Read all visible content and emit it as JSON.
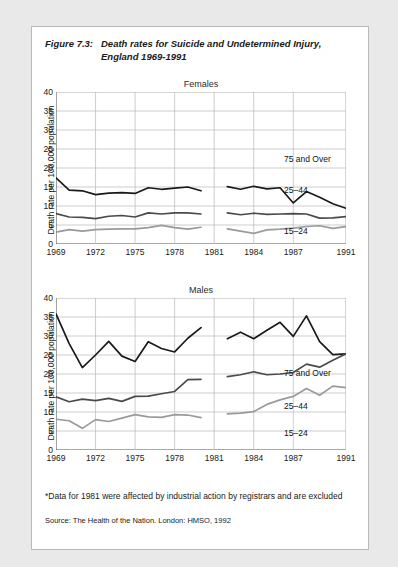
{
  "figure": {
    "number": "Figure 7.3:",
    "title": "Death rates for Suicide and Undetermined Injury, England 1969-1991"
  },
  "footnote": "*Data for 1981 were affected by industrial action by registrars and are excluded",
  "source": "Source: The Health of the Nation. London: HMSO, 1992",
  "axis": {
    "ylabel": "Death rate per 100,000 population",
    "yticks": [
      0,
      5,
      10,
      15,
      20,
      25,
      30,
      35,
      40
    ],
    "xticks": [
      1969,
      1972,
      1975,
      1978,
      1981,
      1984,
      1987,
      1991
    ]
  },
  "colors": {
    "series_75_plus": "#1a1a1a",
    "series_25_44": "#4a4a4a",
    "series_15_24": "#9a9a9a",
    "grid": "#b8b8b8",
    "axis": "#555555",
    "page_background": "#ffffff",
    "canvas_background": "#e9e9e9"
  },
  "chart_data": [
    {
      "type": "line",
      "title": "Females",
      "xlabel": "",
      "ylabel": "Death rate per 100,000 population",
      "xlim": [
        1969,
        1991
      ],
      "ylim": [
        0,
        40
      ],
      "grid": true,
      "legend_position": "inline-right",
      "xticks": [
        1969,
        1972,
        1975,
        1978,
        1981,
        1984,
        1987,
        1991
      ],
      "yticks": [
        0,
        5,
        10,
        15,
        20,
        25,
        30,
        35,
        40
      ],
      "gap_years": [
        1981
      ],
      "series": [
        {
          "name": "75 and Over",
          "color": "#1a1a1a",
          "x": [
            1969,
            1970,
            1971,
            1972,
            1973,
            1974,
            1975,
            1976,
            1977,
            1978,
            1979,
            1980,
            1982,
            1983,
            1984,
            1985,
            1986,
            1987,
            1988,
            1989,
            1990,
            1991
          ],
          "values": [
            17.4,
            14.2,
            14.0,
            13.0,
            13.4,
            13.5,
            13.3,
            14.8,
            14.4,
            14.7,
            15.0,
            14.0,
            15.1,
            14.4,
            15.2,
            14.5,
            14.8,
            10.8,
            13.8,
            12.3,
            10.6,
            9.4
          ]
        },
        {
          "name": "25–44",
          "color": "#4a4a4a",
          "x": [
            1969,
            1970,
            1971,
            1972,
            1973,
            1974,
            1975,
            1976,
            1977,
            1978,
            1979,
            1980,
            1982,
            1983,
            1984,
            1985,
            1986,
            1987,
            1988,
            1989,
            1990,
            1991
          ],
          "values": [
            8.0,
            7.1,
            7.0,
            6.7,
            7.3,
            7.5,
            7.1,
            8.2,
            7.9,
            8.2,
            8.2,
            7.9,
            8.2,
            7.7,
            8.1,
            7.8,
            7.9,
            8.0,
            7.9,
            6.8,
            6.9,
            7.2
          ]
        },
        {
          "name": "15–24",
          "color": "#9a9a9a",
          "x": [
            1969,
            1970,
            1971,
            1972,
            1973,
            1974,
            1975,
            1976,
            1977,
            1978,
            1979,
            1980,
            1982,
            1983,
            1984,
            1985,
            1986,
            1987,
            1988,
            1989,
            1990,
            1991
          ],
          "values": [
            3.1,
            3.8,
            3.4,
            3.8,
            3.9,
            4.0,
            4.0,
            4.3,
            4.9,
            4.3,
            3.9,
            4.4,
            4.0,
            3.4,
            2.8,
            3.7,
            3.9,
            4.2,
            4.6,
            4.8,
            4.1,
            4.6
          ]
        }
      ]
    },
    {
      "type": "line",
      "title": "Males",
      "xlabel": "",
      "ylabel": "Death rate per 100,000 population",
      "xlim": [
        1969,
        1991
      ],
      "ylim": [
        0,
        40
      ],
      "grid": true,
      "legend_position": "inline-right",
      "xticks": [
        1969,
        1972,
        1975,
        1978,
        1981,
        1984,
        1987,
        1991
      ],
      "yticks": [
        0,
        5,
        10,
        15,
        20,
        25,
        30,
        35,
        40
      ],
      "gap_years": [
        1981
      ],
      "series": [
        {
          "name": "75 and Over",
          "color": "#1a1a1a",
          "x": [
            1969,
            1970,
            1971,
            1972,
            1973,
            1974,
            1975,
            1976,
            1977,
            1978,
            1979,
            1980,
            1982,
            1983,
            1984,
            1985,
            1986,
            1987,
            1988,
            1989,
            1990,
            1991
          ],
          "values": [
            35.8,
            28.0,
            21.7,
            25.0,
            28.6,
            24.7,
            23.3,
            28.5,
            26.7,
            25.8,
            29.4,
            32.2,
            29.3,
            31.0,
            29.3,
            31.5,
            33.6,
            29.9,
            35.3,
            28.5,
            25.1,
            25.3
          ]
        },
        {
          "name": "25–44",
          "color": "#4a4a4a",
          "x": [
            1969,
            1970,
            1971,
            1972,
            1973,
            1974,
            1975,
            1976,
            1977,
            1978,
            1979,
            1980,
            1982,
            1983,
            1984,
            1985,
            1986,
            1987,
            1988,
            1989,
            1990,
            1991
          ],
          "values": [
            14.0,
            12.7,
            13.4,
            13.0,
            13.6,
            12.8,
            14.1,
            14.2,
            14.8,
            15.4,
            18.5,
            18.6,
            19.3,
            19.8,
            20.6,
            19.8,
            20.0,
            20.4,
            22.6,
            21.8,
            23.6,
            25.3
          ]
        },
        {
          "name": "15–24",
          "color": "#9a9a9a",
          "x": [
            1969,
            1970,
            1971,
            1972,
            1973,
            1974,
            1975,
            1976,
            1977,
            1978,
            1979,
            1980,
            1982,
            1983,
            1984,
            1985,
            1986,
            1987,
            1988,
            1989,
            1990,
            1991
          ],
          "values": [
            8.1,
            7.7,
            5.7,
            8.0,
            7.5,
            8.4,
            9.3,
            8.7,
            8.6,
            9.3,
            9.2,
            8.5,
            9.5,
            9.7,
            10.1,
            12.0,
            13.2,
            14.1,
            16.2,
            14.4,
            16.8,
            16.4
          ]
        }
      ]
    }
  ],
  "series_labels": {
    "females": [
      {
        "text": "75 and Over",
        "left": 228,
        "top": 62
      },
      {
        "text": "25–44",
        "left": 228,
        "top": 93
      },
      {
        "text": "15–24",
        "left": 228,
        "top": 134
      }
    ],
    "males": [
      {
        "text": "75 and Over",
        "left": 228,
        "top": 70
      },
      {
        "text": "25–44",
        "left": 228,
        "top": 103
      },
      {
        "text": "15–24",
        "left": 228,
        "top": 130
      }
    ]
  }
}
